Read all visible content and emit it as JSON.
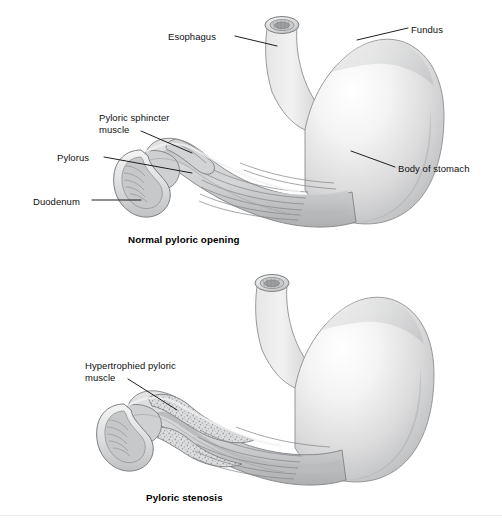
{
  "page": {
    "background_color": "#ffffff",
    "width": 502,
    "height": 528,
    "cropped_header_text": "",
    "divider_color": "#e9eaee"
  },
  "palette": {
    "outline": "#6f7175",
    "label_text": "#101010",
    "caption_text": "#000000",
    "leader_line": "#141414",
    "serosa_light": "#f2f2f2",
    "muscle_mid": "#c9cacb",
    "muscle_dark": "#9a9c9e",
    "mucosa_fold": "#8e9092",
    "hypertrophy_stipple": "#b7b9bb"
  },
  "figures": [
    {
      "id": "normal",
      "caption": "Normal pyloric opening",
      "caption_position": {
        "x": 128,
        "y": 234
      },
      "labels": [
        {
          "id": "esophagus",
          "text": "Esophagus",
          "lines": [
            "Esophagus"
          ],
          "x": 168,
          "y": 31,
          "align": "left",
          "leader": {
            "x1": 235,
            "y1": 36,
            "x2": 277,
            "y2": 46
          }
        },
        {
          "id": "fundus",
          "text": "Fundus",
          "lines": [
            "Fundus"
          ],
          "x": 411,
          "y": 24,
          "align": "left",
          "leader": {
            "x1": 408,
            "y1": 28,
            "x2": 357,
            "y2": 40
          }
        },
        {
          "id": "pyloric-sphincter-muscle",
          "text": "Pyloric sphincter muscle",
          "lines": [
            "Pyloric sphincter",
            "muscle"
          ],
          "x": 99,
          "y": 112,
          "align": "left",
          "leader": {
            "x1": 141,
            "y1": 131,
            "x2": 192,
            "y2": 153
          }
        },
        {
          "id": "pylorus",
          "text": "Pylorus",
          "lines": [
            "Pylorus"
          ],
          "x": 57,
          "y": 152,
          "align": "left",
          "leader": {
            "x1": 104,
            "y1": 157,
            "x2": 192,
            "y2": 173
          }
        },
        {
          "id": "body-of-stomach",
          "text": "Body of stomach",
          "lines": [
            "Body of stomach"
          ],
          "x": 398,
          "y": 163,
          "align": "left",
          "leader": {
            "x1": 395,
            "y1": 167,
            "x2": 351,
            "y2": 151
          }
        },
        {
          "id": "duodenum",
          "text": "Duodenum",
          "lines": [
            "Duodenum"
          ],
          "x": 33,
          "y": 196,
          "align": "left",
          "leader": {
            "x1": 92,
            "y1": 200,
            "x2": 141,
            "y2": 200
          }
        }
      ]
    },
    {
      "id": "stenosis",
      "caption": "Pyloric stenosis",
      "caption_position": {
        "x": 146,
        "y": 492
      },
      "labels": [
        {
          "id": "hypertrophied-pyloric-muscle",
          "text": "Hypertrophied pyloric muscle",
          "lines": [
            "Hypertrophied pyloric",
            "muscle"
          ],
          "x": 85,
          "y": 360,
          "align": "left",
          "leader": {
            "x1": 128,
            "y1": 379,
            "x2": 177,
            "y2": 410
          }
        }
      ]
    }
  ]
}
